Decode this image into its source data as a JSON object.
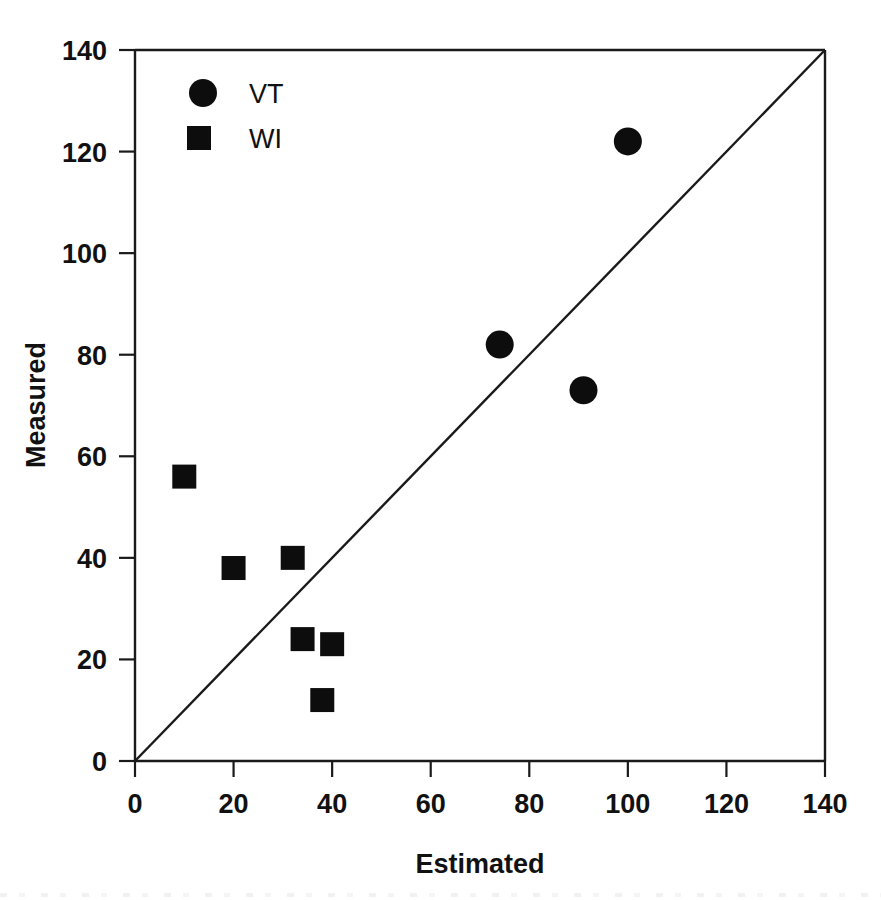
{
  "chart_data": {
    "type": "scatter",
    "title": "",
    "xlabel": "Estimated",
    "ylabel": "Measured",
    "xlim": [
      0,
      140
    ],
    "ylim": [
      0,
      140
    ],
    "xticks": [
      0,
      20,
      40,
      60,
      80,
      100,
      120,
      140
    ],
    "yticks": [
      0,
      20,
      40,
      60,
      80,
      100,
      120,
      140
    ],
    "xtick_labels": [
      "0",
      "20",
      "40",
      "60",
      "80",
      "100",
      "120",
      "140"
    ],
    "ytick_labels": [
      "0",
      "20",
      "40",
      "60",
      "80",
      "100",
      "120",
      "140"
    ],
    "grid": false,
    "legend_position": "top-left-inside",
    "reference_line": {
      "name": "1:1 line",
      "from": [
        0,
        0
      ],
      "to": [
        140,
        140
      ]
    },
    "series": [
      {
        "name": "VT",
        "marker": "circle",
        "color": "#0d0d0d",
        "points": [
          {
            "x": 74,
            "y": 82
          },
          {
            "x": 91,
            "y": 73
          },
          {
            "x": 100,
            "y": 122
          }
        ]
      },
      {
        "name": "WI",
        "marker": "square",
        "color": "#0d0d0d",
        "points": [
          {
            "x": 10,
            "y": 56
          },
          {
            "x": 20,
            "y": 38
          },
          {
            "x": 32,
            "y": 40
          },
          {
            "x": 34,
            "y": 24
          },
          {
            "x": 40,
            "y": 23
          },
          {
            "x": 38,
            "y": 12
          }
        ]
      }
    ]
  },
  "legend": {
    "entries": [
      {
        "label": "VT",
        "marker": "circle"
      },
      {
        "label": "WI",
        "marker": "square"
      }
    ]
  }
}
